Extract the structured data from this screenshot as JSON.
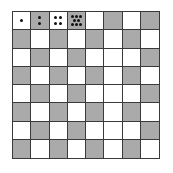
{
  "board": {
    "rows": 8,
    "cols": 8,
    "colors": {
      "light": "#ffffff",
      "dark": "#aaaaaa",
      "grid": "#3a3a3a",
      "dot": "#111111"
    },
    "pattern": [
      [
        "W",
        "G",
        "W",
        "G",
        "W",
        "G",
        "W",
        "G"
      ],
      [
        "G",
        "W",
        "G",
        "W",
        "G",
        "W",
        "G",
        "W"
      ],
      [
        "W",
        "G",
        "W",
        "G",
        "W",
        "W",
        "W",
        "G"
      ],
      [
        "G",
        "W",
        "G",
        "W",
        "G",
        "W",
        "G",
        "W"
      ],
      [
        "W",
        "G",
        "W",
        "G",
        "W",
        "W",
        "W",
        "G"
      ],
      [
        "G",
        "W",
        "G",
        "W",
        "G",
        "W",
        "G",
        "W"
      ],
      [
        "W",
        "G",
        "W",
        "G",
        "W",
        "W",
        "W",
        "G"
      ],
      [
        "G",
        "W",
        "G",
        "W",
        "G",
        "W",
        "G",
        "W"
      ]
    ],
    "dot_squares": [
      {
        "row": 0,
        "col": 0,
        "count": 1,
        "layout": [
          [
            50,
            50
          ]
        ]
      },
      {
        "row": 0,
        "col": 1,
        "count": 2,
        "layout": [
          [
            50,
            33
          ],
          [
            50,
            67
          ]
        ]
      },
      {
        "row": 0,
        "col": 2,
        "count": 4,
        "layout": [
          [
            35,
            33
          ],
          [
            65,
            33
          ],
          [
            35,
            67
          ],
          [
            65,
            67
          ]
        ]
      },
      {
        "row": 0,
        "col": 3,
        "count": 8,
        "layout": [
          [
            25,
            25
          ],
          [
            50,
            25
          ],
          [
            75,
            25
          ],
          [
            37,
            50
          ],
          [
            63,
            50
          ],
          [
            25,
            75
          ],
          [
            50,
            75
          ],
          [
            75,
            75
          ]
        ]
      }
    ]
  }
}
